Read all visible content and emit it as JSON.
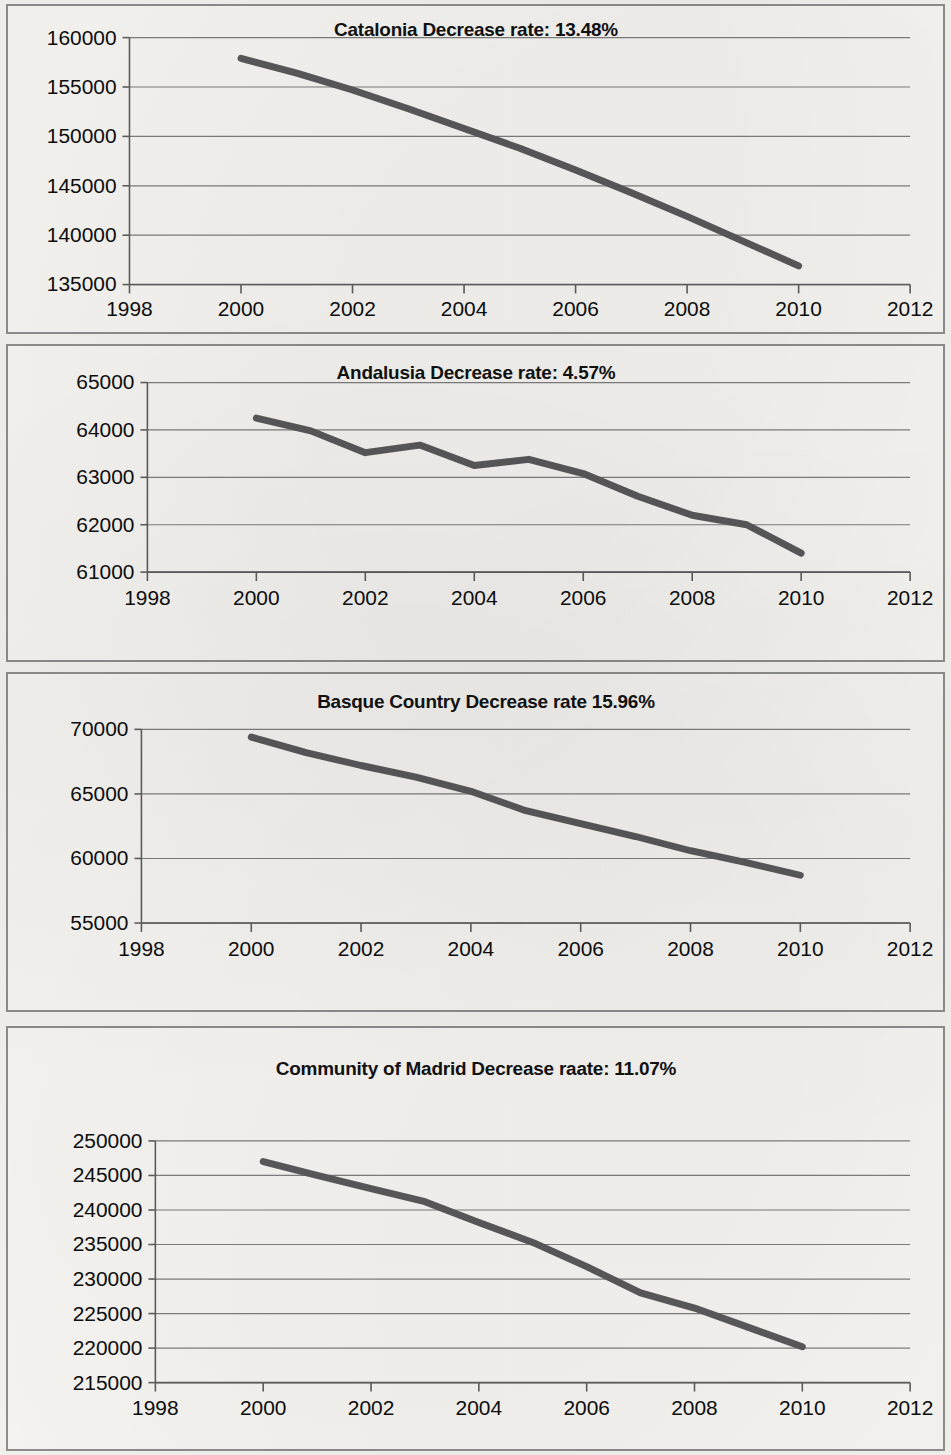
{
  "page": {
    "background_color": "#f3f2ef",
    "panel_border_color": "#8d8d8d",
    "series_color": "#59595c",
    "grid_color": "#7d7d7d"
  },
  "panels": [
    {
      "id": "catalonia",
      "title": "Catalonia Decrease rate: 13.48%"
    },
    {
      "id": "andalusia",
      "title": "Andalusia Decrease rate: 4.57%"
    },
    {
      "id": "basque",
      "title": "Basque Country Decrease rate 15.96%"
    },
    {
      "id": "madrid",
      "title": "Community of Madrid Decrease raate: 11.07%"
    }
  ],
  "chart_data": [
    {
      "type": "line",
      "title": "Catalonia Decrease rate: 13.48%",
      "region": "Catalonia",
      "decrease_rate": "13.48%",
      "xlabel": "",
      "ylabel": "",
      "x": [
        2000,
        2001,
        2002,
        2003,
        2004,
        2005,
        2006,
        2007,
        2008,
        2009,
        2010
      ],
      "values": [
        157900,
        156400,
        154700,
        152800,
        150800,
        148800,
        146600,
        144300,
        141900,
        139400,
        136900
      ],
      "xlim": [
        1998,
        2012
      ],
      "ylim": [
        135000,
        160000
      ],
      "xticks": [
        1998,
        2000,
        2002,
        2004,
        2006,
        2008,
        2010,
        2012
      ],
      "yticks": [
        135000,
        140000,
        145000,
        150000,
        155000,
        160000
      ],
      "xtick_labels": [
        "1998",
        "2000",
        "2002",
        "2004",
        "2006",
        "2008",
        "2010",
        "2012"
      ],
      "ytick_labels": [
        "135000",
        "140000",
        "145000",
        "150000",
        "155000",
        "160000"
      ],
      "grid": true,
      "legend": false
    },
    {
      "type": "line",
      "title": "Andalusia Decrease rate: 4.57%",
      "region": "Andalusia",
      "decrease_rate": "4.57%",
      "xlabel": "",
      "ylabel": "",
      "x": [
        2000,
        2001,
        2002,
        2003,
        2004,
        2005,
        2006,
        2007,
        2008,
        2009,
        2010
      ],
      "values": [
        64250,
        63980,
        63520,
        63680,
        63250,
        63380,
        63080,
        62600,
        62200,
        62000,
        61400
      ],
      "xlim": [
        1998,
        2012
      ],
      "ylim": [
        61000,
        65000
      ],
      "xticks": [
        1998,
        2000,
        2002,
        2004,
        2006,
        2008,
        2010,
        2012
      ],
      "yticks": [
        61000,
        62000,
        63000,
        64000,
        65000
      ],
      "xtick_labels": [
        "1998",
        "2000",
        "2002",
        "2004",
        "2006",
        "2008",
        "2010",
        "2012"
      ],
      "ytick_labels": [
        "61000",
        "62000",
        "63000",
        "64000",
        "65000"
      ],
      "grid": true,
      "legend": false
    },
    {
      "type": "line",
      "title": "Basque Country Decrease rate 15.96%",
      "region": "Basque Country",
      "decrease_rate": "15.96%",
      "xlabel": "",
      "ylabel": "",
      "x": [
        2000,
        2001,
        2002,
        2003,
        2004,
        2005,
        2006,
        2007,
        2008,
        2009,
        2010
      ],
      "values": [
        69400,
        68200,
        67200,
        66300,
        65200,
        63700,
        62700,
        61700,
        60600,
        59700,
        58700
      ],
      "xlim": [
        1998,
        2012
      ],
      "ylim": [
        55000,
        70000
      ],
      "xticks": [
        1998,
        2000,
        2002,
        2004,
        2006,
        2008,
        2010,
        2012
      ],
      "yticks": [
        55000,
        60000,
        65000,
        70000
      ],
      "xtick_labels": [
        "1998",
        "2000",
        "2002",
        "2004",
        "2006",
        "2008",
        "2010",
        "2012"
      ],
      "ytick_labels": [
        "55000",
        "60000",
        "65000",
        "70000"
      ],
      "grid": true,
      "legend": false
    },
    {
      "type": "line",
      "title": "Community of Madrid Decrease raate: 11.07%",
      "region": "Community of Madrid",
      "decrease_rate": "11.07%",
      "xlabel": "",
      "ylabel": "",
      "x": [
        2000,
        2001,
        2002,
        2003,
        2004,
        2005,
        2006,
        2007,
        2008,
        2009,
        2010
      ],
      "values": [
        247000,
        245000,
        243100,
        241200,
        238200,
        235300,
        231800,
        228000,
        225800,
        223000,
        220200
      ],
      "xlim": [
        1998,
        2012
      ],
      "ylim": [
        215000,
        250000
      ],
      "xticks": [
        1998,
        2000,
        2002,
        2004,
        2006,
        2008,
        2010,
        2012
      ],
      "yticks": [
        215000,
        220000,
        225000,
        230000,
        235000,
        240000,
        245000,
        250000
      ],
      "xtick_labels": [
        "1998",
        "2000",
        "2002",
        "2004",
        "2006",
        "2008",
        "2010",
        "2012"
      ],
      "ytick_labels": [
        "215000",
        "220000",
        "225000",
        "230000",
        "235000",
        "240000",
        "245000",
        "250000"
      ],
      "grid": true,
      "legend": false
    }
  ]
}
